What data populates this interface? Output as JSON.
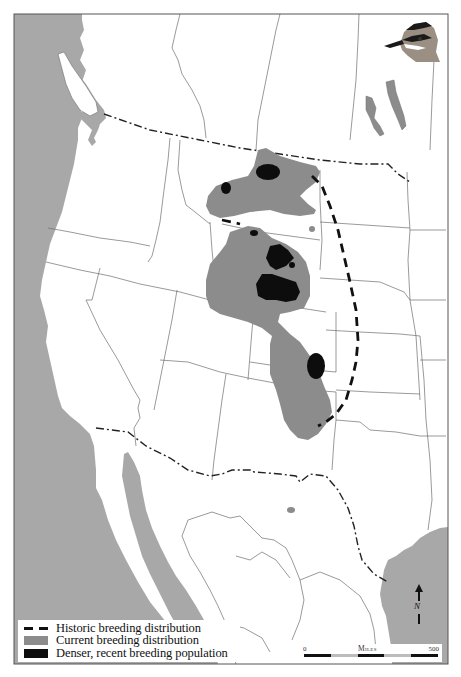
{
  "figure": {
    "type": "species range map",
    "region": "Western North America (western USA, southwestern Canada, northern Mexico)",
    "colors": {
      "ocean": "#a8a8a8",
      "land": "#ffffff",
      "borders": "#6e6e6e",
      "current_range": "#8c8c8c",
      "dense_population": "#0d0d0d",
      "historic_line": "#111111"
    }
  },
  "legend": {
    "items": [
      {
        "symbol": "dashed-line",
        "label": "Historic breeding distribution"
      },
      {
        "symbol": "gray-fill",
        "label": "Current breeding distribution"
      },
      {
        "symbol": "black-fill",
        "label": "Denser, recent breeding population"
      }
    ]
  },
  "scale": {
    "title": "Miles",
    "min_label": "0",
    "max_label": "500"
  },
  "north_arrow": {
    "label": "N"
  },
  "inset": {
    "illustration": "plover-head"
  }
}
